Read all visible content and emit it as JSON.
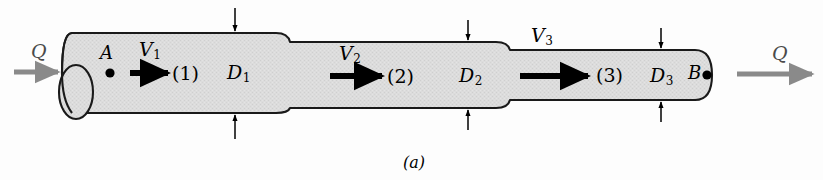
{
  "figure": {
    "caption": "(a)",
    "colors": {
      "pipe_fill": "#dcdcdc",
      "pipe_outline": "#1a1a1a",
      "flow_arrow": "#8a8a8a",
      "velocity_arrow": "#000000",
      "background": "#fdfdfd"
    }
  },
  "flow": {
    "inlet_label": "Q",
    "outlet_label": "Q"
  },
  "points": {
    "inlet_point": "A",
    "outlet_point": "B"
  },
  "sections": [
    {
      "id": "1",
      "velocity_label": "V",
      "velocity_subscript": "1",
      "section_label": "(1)",
      "diameter_label": "D",
      "diameter_subscript": "1"
    },
    {
      "id": "2",
      "velocity_label": "V",
      "velocity_subscript": "2",
      "section_label": "(2)",
      "diameter_label": "D",
      "diameter_subscript": "2"
    },
    {
      "id": "3",
      "velocity_label": "V",
      "velocity_subscript": "3",
      "section_label": "(3)",
      "diameter_label": "D",
      "diameter_subscript": "3"
    }
  ]
}
